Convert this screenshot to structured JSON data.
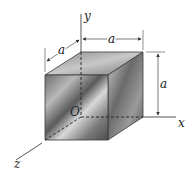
{
  "figure": {
    "labels": {
      "y_axis": "y",
      "x_axis": "x",
      "z_axis": "z",
      "origin": "O",
      "dim_depth": "a",
      "dim_width": "a",
      "dim_height": "a"
    },
    "colors": {
      "edge": "#3a3a3a",
      "axis": "#555555",
      "dimension_line": "#444444"
    }
  }
}
